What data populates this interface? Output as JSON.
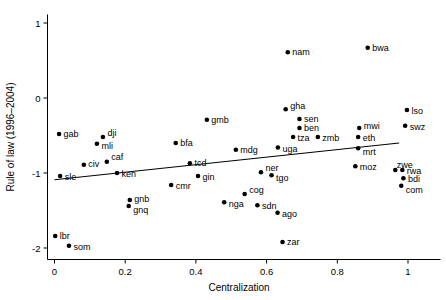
{
  "chart_data": {
    "type": "scatter",
    "title": "",
    "xlabel": "Centralization",
    "ylabel": "Rule of law (1996–2004)",
    "xlim": [
      -0.02,
      1.03
    ],
    "ylim": [
      -2.05,
      1.08
    ],
    "xticks": [
      0,
      0.2,
      0.4,
      0.6,
      0.8,
      1
    ],
    "xticklabels": [
      "0",
      "0.2",
      "0.4",
      "0.6",
      "0.8",
      "1"
    ],
    "yticks": [
      1,
      0,
      -1,
      -2
    ],
    "yticklabels": [
      "1",
      "0",
      "-1",
      "-2"
    ],
    "grid": false,
    "legend": null,
    "marker_color": "#000000",
    "line_color": "#000000",
    "fit_line": {
      "label": "linear fit",
      "x": [
        0.0,
        0.975
      ],
      "y": [
        -1.09,
        -0.6
      ]
    },
    "points": [
      {
        "label": "gab",
        "x": 0.013,
        "y": -0.48,
        "lx": 1,
        "ly": 0
      },
      {
        "label": "dji",
        "x": 0.137,
        "y": -0.52,
        "lx": 1,
        "ly": -4
      },
      {
        "label": "mli",
        "x": 0.12,
        "y": -0.61,
        "lx": 1,
        "ly": 2
      },
      {
        "label": "civ",
        "x": 0.083,
        "y": -0.89,
        "lx": 1,
        "ly": -1
      },
      {
        "label": "caf",
        "x": 0.148,
        "y": -0.85,
        "lx": 1,
        "ly": -5
      },
      {
        "label": "sle",
        "x": 0.016,
        "y": -1.04,
        "lx": 1,
        "ly": 1
      },
      {
        "label": "ken",
        "x": 0.177,
        "y": -1.0,
        "lx": 1,
        "ly": 1
      },
      {
        "label": "gnb",
        "x": 0.213,
        "y": -1.36,
        "lx": 1,
        "ly": -1
      },
      {
        "label": "gnq",
        "x": 0.21,
        "y": -1.44,
        "lx": 1,
        "ly": 4
      },
      {
        "label": "lbr",
        "x": 0.002,
        "y": -1.84,
        "lx": 1,
        "ly": 0
      },
      {
        "label": "som",
        "x": 0.041,
        "y": -1.97,
        "lx": 1,
        "ly": 1
      },
      {
        "label": "gmb",
        "x": 0.431,
        "y": -0.29,
        "lx": 1,
        "ly": 0
      },
      {
        "label": "bfa",
        "x": 0.343,
        "y": -0.6,
        "lx": 1,
        "ly": 0
      },
      {
        "label": "tcd",
        "x": 0.383,
        "y": -0.87,
        "lx": 1,
        "ly": 0
      },
      {
        "label": "gin",
        "x": 0.406,
        "y": -1.04,
        "lx": 1,
        "ly": 1
      },
      {
        "label": "cmr",
        "x": 0.33,
        "y": -1.16,
        "lx": 1,
        "ly": 1
      },
      {
        "label": "mdg",
        "x": 0.513,
        "y": -0.69,
        "lx": 1,
        "ly": 0
      },
      {
        "label": "ner",
        "x": 0.584,
        "y": -0.99,
        "lx": 1,
        "ly": -4
      },
      {
        "label": "tgo",
        "x": 0.614,
        "y": -1.03,
        "lx": 1,
        "ly": 3
      },
      {
        "label": "nga",
        "x": 0.48,
        "y": -1.39,
        "lx": 1,
        "ly": 2
      },
      {
        "label": "cog",
        "x": 0.538,
        "y": -1.28,
        "lx": 1,
        "ly": -4
      },
      {
        "label": "sdn",
        "x": 0.574,
        "y": -1.43,
        "lx": 1,
        "ly": 1
      },
      {
        "label": "ago",
        "x": 0.631,
        "y": -1.53,
        "lx": 1,
        "ly": 1
      },
      {
        "label": "zar",
        "x": 0.645,
        "y": -1.92,
        "lx": 1,
        "ly": 0
      },
      {
        "label": "nam",
        "x": 0.66,
        "y": 0.61,
        "lx": 1,
        "ly": 0
      },
      {
        "label": "bwa",
        "x": 0.886,
        "y": 0.67,
        "lx": 1,
        "ly": 0
      },
      {
        "label": "gha",
        "x": 0.654,
        "y": -0.15,
        "lx": 1,
        "ly": -3
      },
      {
        "label": "sen",
        "x": 0.693,
        "y": -0.28,
        "lx": 1,
        "ly": 0
      },
      {
        "label": "ben",
        "x": 0.693,
        "y": -0.4,
        "lx": 1,
        "ly": 0
      },
      {
        "label": "tza",
        "x": 0.675,
        "y": -0.52,
        "lx": 1,
        "ly": 1
      },
      {
        "label": "zmb",
        "x": 0.745,
        "y": -0.52,
        "lx": 1,
        "ly": 1
      },
      {
        "label": "uga",
        "x": 0.632,
        "y": -0.66,
        "lx": 1,
        "ly": 1
      },
      {
        "label": "mwi",
        "x": 0.862,
        "y": -0.4,
        "lx": 1,
        "ly": -2
      },
      {
        "label": "eth",
        "x": 0.859,
        "y": -0.52,
        "lx": 1,
        "ly": 1
      },
      {
        "label": "mrt",
        "x": 0.859,
        "y": -0.67,
        "lx": 1,
        "ly": 4
      },
      {
        "label": "moz",
        "x": 0.851,
        "y": -0.91,
        "lx": 1,
        "ly": 1
      },
      {
        "label": "lso",
        "x": 0.997,
        "y": -0.16,
        "lx": 1,
        "ly": 1
      },
      {
        "label": "swz",
        "x": 0.992,
        "y": -0.37,
        "lx": 1,
        "ly": 1
      },
      {
        "label": "zwe",
        "x": 0.964,
        "y": -0.96,
        "lx": -2,
        "ly": -5
      },
      {
        "label": "rwa",
        "x": 0.984,
        "y": -0.96,
        "lx": 1,
        "ly": 1
      },
      {
        "label": "bdi",
        "x": 0.987,
        "y": -1.07,
        "lx": 1,
        "ly": 1
      },
      {
        "label": "com",
        "x": 0.981,
        "y": -1.17,
        "lx": 1,
        "ly": 4
      }
    ]
  }
}
